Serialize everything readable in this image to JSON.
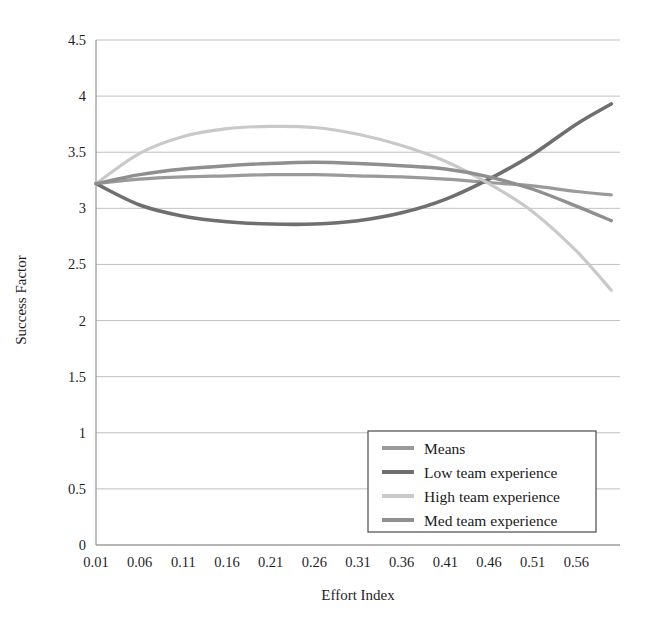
{
  "chart_data": {
    "type": "line",
    "title": "",
    "xlabel": "Effort Index",
    "ylabel": "Success Factor",
    "xlim": [
      0.01,
      0.61
    ],
    "ylim": [
      0,
      4.5
    ],
    "ytick_labels": [
      "0",
      "0.5",
      "1",
      "1.5",
      "2",
      "2.5",
      "3",
      "3.5",
      "4",
      "4.5"
    ],
    "ytick_values": [
      0,
      0.5,
      1,
      1.5,
      2,
      2.5,
      3,
      3.5,
      4,
      4.5
    ],
    "xtick_labels": [
      "0.01",
      "0.06",
      "0.11",
      "0.16",
      "0.21",
      "0.26",
      "0.31",
      "0.36",
      "0.41",
      "0.46",
      "0.51",
      "0.56"
    ],
    "xtick_values": [
      0.01,
      0.06,
      0.11,
      0.16,
      0.21,
      0.26,
      0.31,
      0.36,
      0.41,
      0.46,
      0.51,
      0.56
    ],
    "grid": true,
    "legend_position": "lower right",
    "x": [
      0.01,
      0.06,
      0.11,
      0.16,
      0.21,
      0.26,
      0.31,
      0.36,
      0.41,
      0.46,
      0.51,
      0.56,
      0.6
    ],
    "series": [
      {
        "name": "Means",
        "color": "#9a9a9a",
        "width": 3.2,
        "values": [
          3.22,
          3.26,
          3.28,
          3.29,
          3.3,
          3.3,
          3.29,
          3.28,
          3.26,
          3.23,
          3.2,
          3.15,
          3.12
        ]
      },
      {
        "name": "Low team experience",
        "color": "#6f6f6f",
        "width": 3.6,
        "values": [
          3.22,
          3.03,
          2.93,
          2.88,
          2.86,
          2.86,
          2.89,
          2.96,
          3.08,
          3.26,
          3.48,
          3.75,
          3.93
        ]
      },
      {
        "name": "High team experience",
        "color": "#c9c9c9",
        "width": 3.2,
        "values": [
          3.22,
          3.49,
          3.64,
          3.71,
          3.73,
          3.72,
          3.66,
          3.56,
          3.42,
          3.22,
          2.97,
          2.62,
          2.27
        ]
      },
      {
        "name": "Med team experience",
        "color": "#8f8f8f",
        "width": 3.4,
        "values": [
          3.22,
          3.3,
          3.35,
          3.38,
          3.4,
          3.41,
          3.4,
          3.38,
          3.35,
          3.28,
          3.17,
          3.02,
          2.89
        ]
      }
    ]
  },
  "legend": {
    "items": [
      {
        "label": "Means",
        "color": "#9a9a9a"
      },
      {
        "label": "Low team experience",
        "color": "#6f6f6f"
      },
      {
        "label": "High team experience",
        "color": "#c9c9c9"
      },
      {
        "label": "Med team experience",
        "color": "#8f8f8f"
      }
    ]
  },
  "axes": {
    "x_title": "Effort Index",
    "y_title": "Success Factor"
  }
}
